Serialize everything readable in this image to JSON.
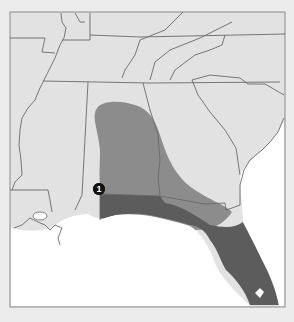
{
  "map": {
    "title": "",
    "region": "Southeastern United States",
    "colors": {
      "background": "#ececec",
      "land": "#e2e2e2",
      "water": "#ffffff",
      "range_primary": "#5c5c5c",
      "range_secondary": "#8c8c8c",
      "borders": "#6a6a6a",
      "frame": "#8a8a8a"
    },
    "legend": [],
    "markers": [
      {
        "id": "1",
        "label": "1"
      }
    ]
  }
}
